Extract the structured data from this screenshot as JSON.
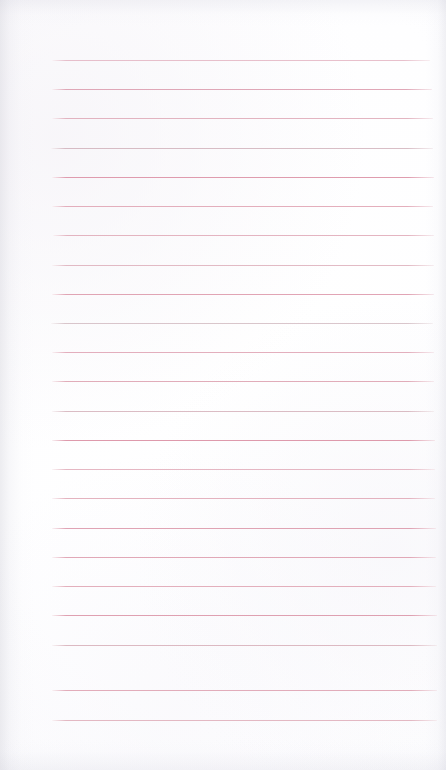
{
  "document": {
    "kind": "scanned-lined-notepad-page",
    "title": "",
    "body_text": "",
    "page_width": 446,
    "page_height": 770,
    "background_color": "#ffffff",
    "paper_color": "#fefeff"
  },
  "ruling": {
    "line_color": "#dca3b4",
    "line_color_strong": "#d08ba1",
    "line_color_faint": "#eac4cf",
    "line_thickness_px": 1.4,
    "line_spacing_px": 29.3,
    "line_left_px": 52,
    "line_right_px": 434,
    "first_line_y_px": 60,
    "line_count": 23,
    "lines": [
      {
        "index": 1,
        "y": 60,
        "left": 52,
        "right": 430,
        "opacity": 0.72,
        "color": "#e0a9b9"
      },
      {
        "index": 2,
        "y": 89,
        "left": 52,
        "right": 432,
        "opacity": 0.88,
        "color": "#dc9cae"
      },
      {
        "index": 3,
        "y": 118,
        "left": 52,
        "right": 433,
        "opacity": 0.8,
        "color": "#ddA3b2"
      },
      {
        "index": 4,
        "y": 148,
        "left": 51,
        "right": 433,
        "opacity": 0.7,
        "color": "#c9a3ae"
      },
      {
        "index": 5,
        "y": 177,
        "left": 52,
        "right": 434,
        "opacity": 0.92,
        "color": "#dd94a8"
      },
      {
        "index": 6,
        "y": 206,
        "left": 52,
        "right": 433,
        "opacity": 0.86,
        "color": "#e0a2b2"
      },
      {
        "index": 7,
        "y": 235,
        "left": 53,
        "right": 434,
        "opacity": 0.82,
        "color": "#dfa5b4"
      },
      {
        "index": 8,
        "y": 265,
        "left": 52,
        "right": 434,
        "opacity": 0.78,
        "color": "#dba8b5"
      },
      {
        "index": 9,
        "y": 294,
        "left": 52,
        "right": 434,
        "opacity": 0.9,
        "color": "#de9bad"
      },
      {
        "index": 10,
        "y": 323,
        "left": 51,
        "right": 433,
        "opacity": 0.66,
        "color": "#c7aab2"
      },
      {
        "index": 11,
        "y": 352,
        "left": 52,
        "right": 434,
        "opacity": 0.84,
        "color": "#dfa0b1"
      },
      {
        "index": 12,
        "y": 381,
        "left": 52,
        "right": 434,
        "opacity": 0.86,
        "color": "#dd9fae"
      },
      {
        "index": 13,
        "y": 411,
        "left": 52,
        "right": 434,
        "opacity": 0.74,
        "color": "#cfa6b0"
      },
      {
        "index": 14,
        "y": 440,
        "left": 52,
        "right": 435,
        "opacity": 0.93,
        "color": "#dc93a6"
      },
      {
        "index": 15,
        "y": 469,
        "left": 52,
        "right": 435,
        "opacity": 0.8,
        "color": "#e0a6b5"
      },
      {
        "index": 16,
        "y": 498,
        "left": 52,
        "right": 435,
        "opacity": 0.82,
        "color": "#dfa3b2"
      },
      {
        "index": 17,
        "y": 528,
        "left": 52,
        "right": 436,
        "opacity": 0.9,
        "color": "#dd9aac"
      },
      {
        "index": 18,
        "y": 557,
        "left": 52,
        "right": 436,
        "opacity": 0.88,
        "color": "#de9dae"
      },
      {
        "index": 19,
        "y": 586,
        "left": 52,
        "right": 436,
        "opacity": 0.84,
        "color": "#dfa1b0"
      },
      {
        "index": 20,
        "y": 615,
        "left": 52,
        "right": 437,
        "opacity": 0.9,
        "color": "#dc97a9"
      },
      {
        "index": 21,
        "y": 645,
        "left": 52,
        "right": 437,
        "opacity": 0.76,
        "color": "#d3a5b0"
      },
      {
        "index": 22,
        "y": 690,
        "left": 52,
        "right": 437,
        "opacity": 0.86,
        "color": "#dea0b0"
      },
      {
        "index": 23,
        "y": 720,
        "left": 52,
        "right": 437,
        "opacity": 0.78,
        "color": "#dda6b3"
      }
    ]
  },
  "margins": {
    "top_blank_px": 60,
    "bottom_blank_px": 50,
    "left_blank_px": 52,
    "right_blank_px": 12
  },
  "scan_artifacts": {
    "left_edge_shadow": true,
    "right_edge_shadow": true,
    "top_edge_shadow": true,
    "bottom_edge_shadow": true,
    "paper_tint": "#fbfbfd"
  }
}
